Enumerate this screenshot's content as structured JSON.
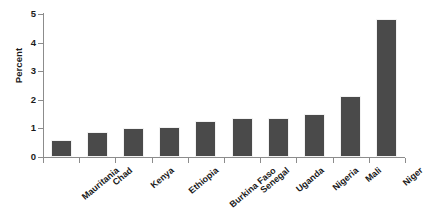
{
  "chart_data": {
    "type": "bar",
    "title": "",
    "subtitle": "",
    "xlabel": "",
    "ylabel": "Percent",
    "categories": [
      "Mauritania",
      "Chad",
      "Kenya",
      "Ethiopia",
      "Burkina Faso",
      "Senegal",
      "Uganda",
      "Nigeria",
      "Mali",
      "Niger"
    ],
    "values": [
      0.58,
      0.89,
      1.0,
      1.05,
      1.27,
      1.36,
      1.36,
      1.51,
      2.14,
      4.83
    ],
    "ylim": [
      0,
      5
    ],
    "ytick_labels": [
      "0",
      "1",
      "2",
      "3",
      "4",
      "5"
    ],
    "ytick_values": [
      0,
      1,
      2,
      3,
      4,
      5
    ],
    "grid": false,
    "legend": null,
    "bar_color": "#4a4a4a",
    "axis_color": "#8c8c8c",
    "background": "#ffffff",
    "annotations": []
  }
}
